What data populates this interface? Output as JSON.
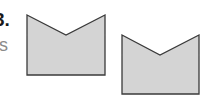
{
  "label": {
    "number": "3.",
    "sub": "s"
  },
  "colors": {
    "fill": "#d4d4d4",
    "stroke": "#3a3a3a"
  },
  "shapes": [
    {
      "name": "pentagon-shape-1",
      "points": "27,15 66,35 105,15 105,75 27,75"
    },
    {
      "name": "pentagon-shape-2",
      "points": "122,35 160,55 199,35 199,94 122,94"
    }
  ]
}
